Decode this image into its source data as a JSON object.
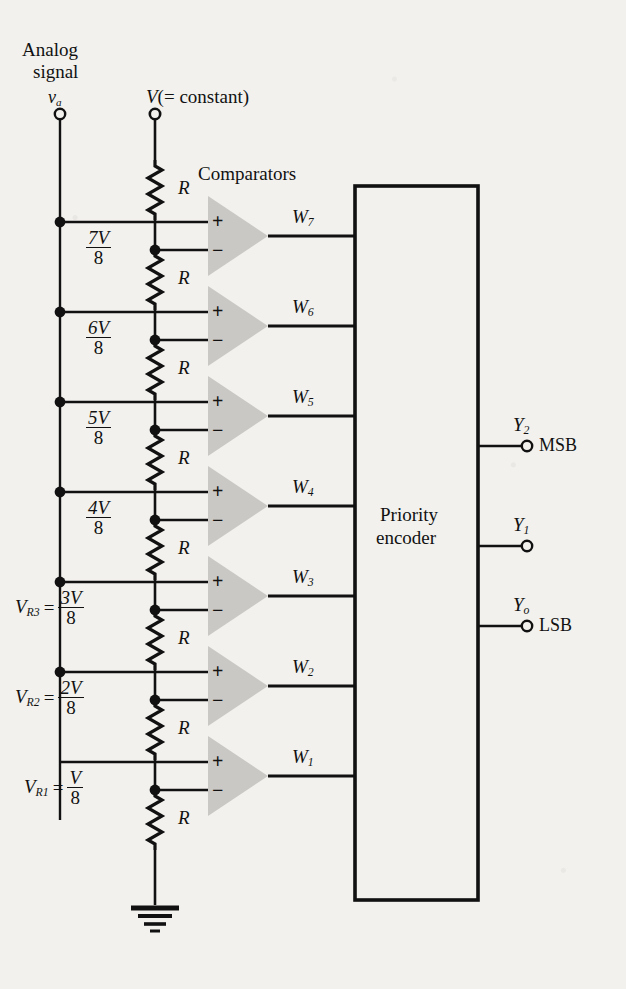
{
  "figure": {
    "type": "3-bit flash (parallel) analog-to-digital converter schematic",
    "analog_input_title_line1": "Analog",
    "analog_input_title_line2": "signal",
    "analog_input_symbol": "v",
    "analog_input_subscript": "a",
    "reference_label": "V(= constant)",
    "comparators_label": "Comparators",
    "encoder_label_line1": "Priority",
    "encoder_label_line2": "encoder",
    "resistor_label": "R",
    "ink_color": "#111111",
    "comparator_fill": "#c9c8c4",
    "page_color": "#f2f1ee"
  },
  "ladder": {
    "resistor_count": 8,
    "resistor_label": "R",
    "taps": [
      {
        "id": "tap7",
        "numerator": "7V",
        "denominator": "8",
        "named": false,
        "name": ""
      },
      {
        "id": "tap6",
        "numerator": "6V",
        "denominator": "8",
        "named": false,
        "name": ""
      },
      {
        "id": "tap5",
        "numerator": "5V",
        "denominator": "8",
        "named": false,
        "name": ""
      },
      {
        "id": "tap4",
        "numerator": "4V",
        "denominator": "8",
        "named": false,
        "name": ""
      },
      {
        "id": "tap3",
        "numerator": "3V",
        "denominator": "8",
        "named": true,
        "name": "V",
        "name_sub": "R3",
        "eq": "="
      },
      {
        "id": "tap2",
        "numerator": "2V",
        "denominator": "8",
        "named": true,
        "name": "V",
        "name_sub": "R2",
        "eq": "="
      },
      {
        "id": "tap1",
        "numerator": "V",
        "denominator": "8",
        "named": true,
        "name": "V",
        "name_sub": "R1",
        "eq": "="
      }
    ]
  },
  "comparators": [
    {
      "plus": "+",
      "minus": "−",
      "out_symbol": "W",
      "out_sub": "7"
    },
    {
      "plus": "+",
      "minus": "−",
      "out_symbol": "W",
      "out_sub": "6"
    },
    {
      "plus": "+",
      "minus": "−",
      "out_symbol": "W",
      "out_sub": "5"
    },
    {
      "plus": "+",
      "minus": "−",
      "out_symbol": "W",
      "out_sub": "4"
    },
    {
      "plus": "+",
      "minus": "−",
      "out_symbol": "W",
      "out_sub": "3"
    },
    {
      "plus": "+",
      "minus": "−",
      "out_symbol": "W",
      "out_sub": "2"
    },
    {
      "plus": "+",
      "minus": "−",
      "out_symbol": "W",
      "out_sub": "1"
    }
  ],
  "outputs": [
    {
      "symbol": "Y",
      "sub": "2",
      "tag": "MSB"
    },
    {
      "symbol": "Y",
      "sub": "1",
      "tag": ""
    },
    {
      "symbol": "Y",
      "sub": "o",
      "tag": "LSB"
    }
  ],
  "ground": {
    "name": "ground-symbol"
  }
}
